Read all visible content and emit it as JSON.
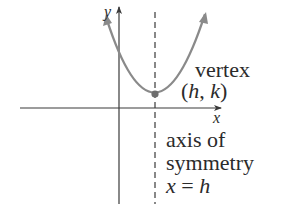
{
  "diagram": {
    "type": "parabola-vertex-form",
    "axes": {
      "x_label": "x",
      "y_label": "y"
    },
    "vertex": {
      "label_line1": "vertex",
      "label_line2": "(h, k)"
    },
    "axis_of_symmetry": {
      "label_line1": "axis of",
      "label_line2": "symmetry",
      "label_line3": "x = h"
    },
    "colors": {
      "axis": "#3a3a3a",
      "curve": "#8a8a8a",
      "text": "#2b2b2b",
      "vertex_point": "#6e6e6e"
    }
  }
}
